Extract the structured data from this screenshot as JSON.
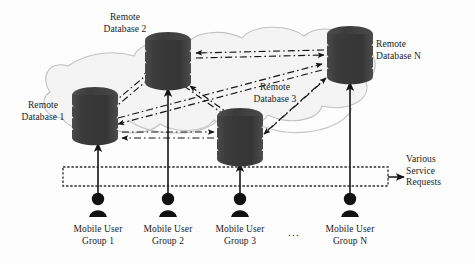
{
  "diagram": {
    "colors": {
      "database_body": "#3d3d3d",
      "database_band_gap": "#ffffff",
      "cloud_stroke": "#b9b9b9",
      "cloud_fill": "#f2f2f2",
      "arrow_solid": "#1a1a1a",
      "arrow_dashed": "#1a1a1a",
      "request_box_stroke": "#2b2b2b",
      "user_icon": "#111111",
      "text": "#1a1a1a"
    },
    "databases": [
      {
        "id": "db1",
        "label_line1": "Remote",
        "label_line2": "Database 1"
      },
      {
        "id": "db2",
        "label_line1": "Remote",
        "label_line2": "Database 2"
      },
      {
        "id": "db3",
        "label_line1": "Remote",
        "label_line2": "Database 3"
      },
      {
        "id": "dbn",
        "label_line1": "Remote",
        "label_line2": "Database N"
      }
    ],
    "user_groups": [
      {
        "id": "group1",
        "label_line1": "Mobile User",
        "label_line2": "Group 1"
      },
      {
        "id": "group2",
        "label_line1": "Mobile User",
        "label_line2": "Group 2"
      },
      {
        "id": "group3",
        "label_line1": "Mobile User",
        "label_line2": "Group 3"
      },
      {
        "id": "groupn",
        "label_line1": "Mobile User",
        "label_line2": "Group N"
      }
    ],
    "ellipsis": "...",
    "service_requests": {
      "line1": "Various",
      "line2": "Service",
      "line3": "Requests"
    }
  }
}
